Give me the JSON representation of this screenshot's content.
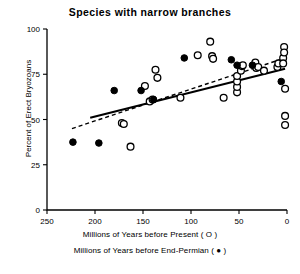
{
  "chart_data": {
    "type": "scatter",
    "title": "Species with narrow branches",
    "xlabel": "Millions of Years before Present (  O  )",
    "xlabel2": "Millions of Years before End-Permian (  ●  )",
    "ylabel": "Percent of Erect Bryozoans",
    "xlim": [
      250,
      0
    ],
    "ylim": [
      0,
      100
    ],
    "x_ticks": [
      250,
      200,
      150,
      100,
      50,
      0
    ],
    "y_ticks": [
      0,
      25,
      50,
      75,
      100
    ],
    "x_reversed": true,
    "grid": false,
    "legend_position": "below-axis",
    "series": [
      {
        "name": "Millions of Years before Present",
        "marker": "open-circle",
        "points": [
          [
            172,
            48
          ],
          [
            170,
            47.5
          ],
          [
            163,
            35
          ],
          [
            148,
            68.5
          ],
          [
            143,
            60
          ],
          [
            140,
            61
          ],
          [
            137,
            77.5
          ],
          [
            135,
            73
          ],
          [
            111,
            62
          ],
          [
            93,
            85.5
          ],
          [
            80,
            93
          ],
          [
            78,
            85
          ],
          [
            77,
            83.5
          ],
          [
            66,
            62
          ],
          [
            52,
            65
          ],
          [
            52,
            68
          ],
          [
            52,
            71
          ],
          [
            52,
            74
          ],
          [
            48,
            77
          ],
          [
            47,
            79.5
          ],
          [
            46,
            80
          ],
          [
            33,
            81.5
          ],
          [
            32,
            78.5
          ],
          [
            30,
            79
          ],
          [
            24,
            77
          ],
          [
            10,
            79
          ],
          [
            9,
            81
          ],
          [
            4,
            84
          ],
          [
            4,
            81
          ],
          [
            3,
            90
          ],
          [
            3,
            87
          ],
          [
            2,
            67
          ],
          [
            2,
            52
          ],
          [
            2,
            47
          ]
        ]
      },
      {
        "name": "Millions of Years before End-Permian",
        "marker": "filled-circle",
        "points": [
          [
            223,
            37.5
          ],
          [
            196,
            37
          ],
          [
            180,
            66
          ],
          [
            152,
            66
          ],
          [
            139,
            61
          ],
          [
            107,
            84
          ],
          [
            58,
            83
          ],
          [
            52,
            80
          ],
          [
            36,
            80
          ],
          [
            6,
            71
          ]
        ]
      }
    ],
    "fit_lines": [
      {
        "name": "solid-regression",
        "style": "solid",
        "x_start": 205,
        "y_start": 51,
        "x_end": 2,
        "y_end": 78
      },
      {
        "name": "dashed-regression",
        "style": "dashed",
        "x_start": 224,
        "y_start": 45,
        "x_end": 2,
        "y_end": 84
      }
    ]
  }
}
